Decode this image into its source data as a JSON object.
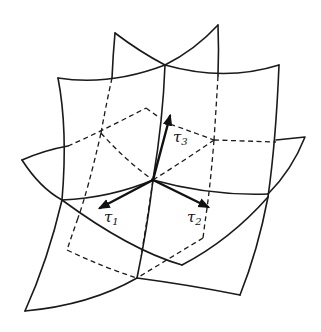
{
  "figure": {
    "stroke_color": "#1a1a1a",
    "background": "#ffffff"
  },
  "labels": {
    "tau1": {
      "symbol": "τ",
      "index": "1"
    },
    "tau2": {
      "symbol": "τ",
      "index": "2"
    },
    "tau3": {
      "symbol": "τ",
      "index": "3"
    }
  }
}
